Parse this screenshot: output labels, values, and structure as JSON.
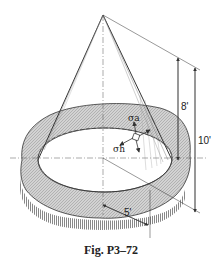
{
  "figure": {
    "caption": "Fig. P3–72",
    "labels": {
      "height_slant_top": "8'",
      "height_total": "10'",
      "radius": "5'",
      "stress_axial": "σa",
      "stress_hoop": "σh"
    },
    "colors": {
      "line": "#333333",
      "ground_fill": "#c9c9c9",
      "background": "#ffffff"
    }
  }
}
